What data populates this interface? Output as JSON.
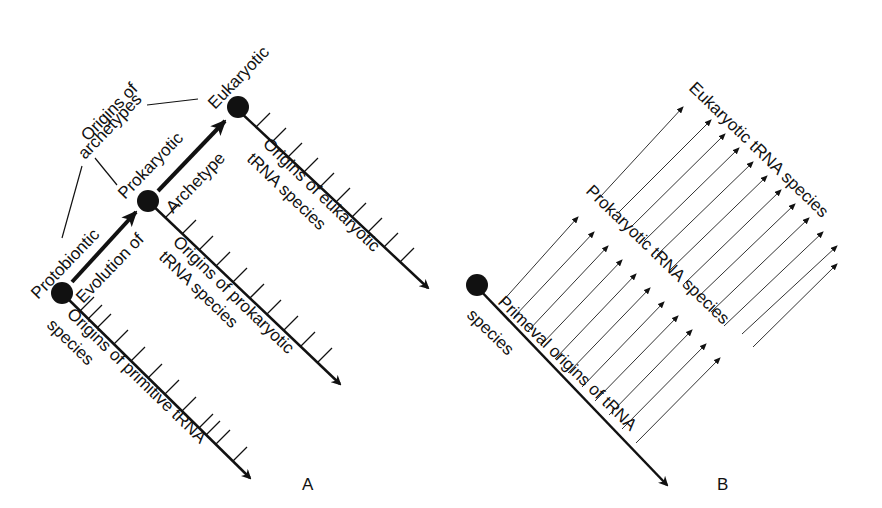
{
  "panel_a": {
    "label": "A",
    "nodes": [
      "Protobiontic",
      "Prokaryotic",
      "Eukaryotic"
    ],
    "origins_of_archetypes": [
      "Origins of",
      "archetypes"
    ],
    "evolution_label": "Evolution of",
    "archetype_label": "Archetype",
    "axis_labels": {
      "primitive": [
        "Origins of primitive tRNA",
        "species"
      ],
      "prokaryotic": [
        "Origins of prokaryotic",
        "tRNA species"
      ],
      "eukaryotic": [
        "Origins of eukaryotic",
        "tRNA species"
      ]
    }
  },
  "panel_b": {
    "label": "B",
    "axis_label": [
      "Primeval origins of tRNA",
      "species"
    ],
    "prokaryotic_label": "Prokaryotic tRNA species",
    "eukaryotic_label": "Eukaryotic tRNA species"
  }
}
